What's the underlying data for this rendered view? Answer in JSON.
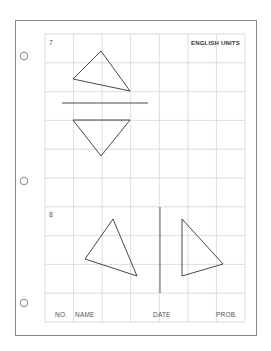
{
  "sheet": {
    "units_label": "ENGLISH UNITS",
    "problems": [
      {
        "number": "7"
      },
      {
        "number": "8"
      }
    ],
    "footer": {
      "no_label": "NO.",
      "name_label": "NAME",
      "date_label": "DATE",
      "prob_label": "PROB."
    },
    "grid": {
      "columns": 7,
      "rows": 10,
      "line_color": "#d4d4d4"
    },
    "line_color": "#333333",
    "border_color": "#8a8a8a"
  },
  "holes": [
    {
      "cx": 24,
      "cy": 56
    },
    {
      "cx": 24,
      "cy": 181
    },
    {
      "cx": 24,
      "cy": 303
    }
  ]
}
